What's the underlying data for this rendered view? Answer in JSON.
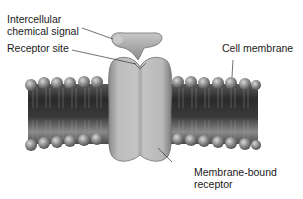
{
  "labels": {
    "signal_line1": "Intercellular",
    "signal_line2": "chemical signal",
    "receptor_site": "Receptor site",
    "cell_membrane": "Cell membrane",
    "bound_line1": "Membrane-bound",
    "bound_line2": "receptor"
  },
  "colors": {
    "membrane_dark": "#2e2e2e",
    "membrane_mid": "#6b6b6b",
    "head": "#8a8a8a",
    "receptor": "#b4b4b4",
    "signal": "#a8a8a8",
    "leader_line": "#333333",
    "text": "#1a1a1a"
  }
}
